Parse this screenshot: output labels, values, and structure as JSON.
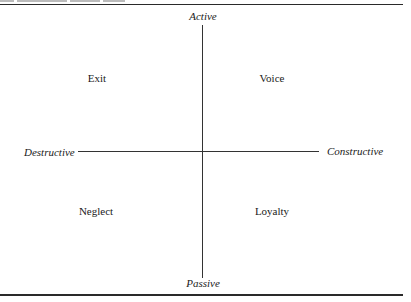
{
  "diagram": {
    "type": "quadrant",
    "axes": {
      "vertical": {
        "top": "Active",
        "bottom": "Passive"
      },
      "horizontal": {
        "left": "Destructive",
        "right": "Constructive"
      }
    },
    "quadrants": {
      "top_left": "Exit",
      "top_right": "Voice",
      "bottom_left": "Neglect",
      "bottom_right": "Loyalty"
    }
  }
}
